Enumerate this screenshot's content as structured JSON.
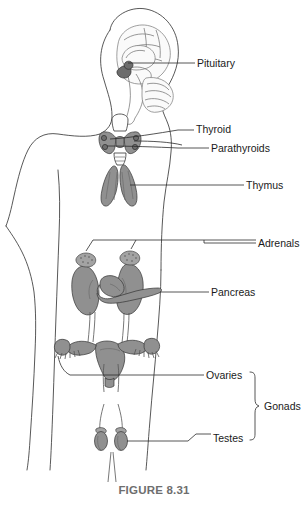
{
  "figure": {
    "caption": "FIGURE 8.31",
    "body_outline_name": "human-torso-silhouette"
  },
  "labels": [
    {
      "id": "pituitary",
      "text": "Pituitary",
      "x": 197,
      "y": 63,
      "leader": "horizontal"
    },
    {
      "id": "thyroid",
      "text": "Thyroid",
      "x": 196,
      "y": 129,
      "leader": "horizontal"
    },
    {
      "id": "parathyroids",
      "text": "Parathyroids",
      "x": 211,
      "y": 148,
      "leader": "curve"
    },
    {
      "id": "thymus",
      "text": "Thymus",
      "x": 246,
      "y": 185,
      "leader": "horizontal"
    },
    {
      "id": "adrenals",
      "text": "Adrenals",
      "x": 258,
      "y": 243,
      "leader": "forked"
    },
    {
      "id": "pancreas",
      "text": "Pancreas",
      "x": 211,
      "y": 292,
      "leader": "horizontal"
    },
    {
      "id": "ovaries",
      "text": "Ovaries",
      "x": 206,
      "y": 375,
      "leader": "horizontal"
    },
    {
      "id": "testes",
      "text": "Testes",
      "x": 213,
      "y": 438,
      "leader": "stepped"
    },
    {
      "id": "gonads",
      "text": "Gonads",
      "x": 264,
      "y": 407,
      "leader": "bracket"
    }
  ],
  "organs": [
    {
      "id": "brain",
      "name": "brain-sagittal-section"
    },
    {
      "id": "pituitary",
      "name": "pituitary-gland"
    },
    {
      "id": "thyroid",
      "name": "thyroid-gland"
    },
    {
      "id": "parathyroids",
      "name": "parathyroid-glands"
    },
    {
      "id": "thymus",
      "name": "thymus-gland"
    },
    {
      "id": "adrenals",
      "name": "adrenal-glands"
    },
    {
      "id": "kidneys",
      "name": "kidneys"
    },
    {
      "id": "pancreas",
      "name": "pancreas"
    },
    {
      "id": "ovaries",
      "name": "ovaries-uterus"
    },
    {
      "id": "testes",
      "name": "testes"
    }
  ],
  "colors": {
    "organ_grey": "#909090",
    "organ_dark_grey": "#6d6d6d",
    "organ_light": "#fdfdfd",
    "outline": "#3a3a3a",
    "label_text": "#1a1a1a",
    "caption_text": "#6e6e6e",
    "background": "#ffffff"
  }
}
